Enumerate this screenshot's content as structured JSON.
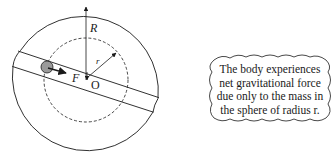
{
  "diagram": {
    "labels": {
      "outer_radius": "R",
      "inner_radius": "r",
      "force": "F",
      "center": "O"
    },
    "colors": {
      "stroke": "#1a1a1a",
      "body_fill": "#9a9a9a",
      "background": "#ffffff"
    }
  },
  "callout": {
    "lines": [
      "The body experiences",
      "net gravitational force",
      "due only to the mass in",
      "the sphere of radius r."
    ]
  }
}
